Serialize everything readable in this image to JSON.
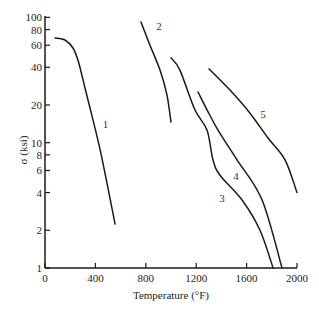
{
  "chart_data": {
    "type": "line",
    "title": "",
    "xlabel": "Temperature (°F)",
    "ylabel": "σ (ksi)",
    "xlim": [
      0,
      2000
    ],
    "ylim": [
      1,
      100
    ],
    "yscale": "log",
    "grid": false,
    "legend": "none (curves labeled inline 1–5)",
    "x_ticks": [
      0,
      400,
      800,
      1200,
      1600,
      2000
    ],
    "x_tick_labels": [
      "0",
      "400",
      "800",
      "1200",
      "1600",
      "2000"
    ],
    "y_ticks": [
      1,
      2,
      4,
      6,
      8,
      10,
      20,
      40,
      60,
      80,
      100
    ],
    "y_tick_labels": [
      "1",
      "2",
      "4",
      "6",
      "8",
      "10",
      "20",
      "40",
      "60",
      "80",
      "100"
    ],
    "series": [
      {
        "name": "1",
        "label_pos": [
          480,
          14
        ],
        "points": [
          [
            79,
            68.5
          ],
          [
            159,
            66
          ],
          [
            222,
            57
          ],
          [
            262,
            45.5
          ],
          [
            302,
            31.6
          ],
          [
            341,
            21.9
          ],
          [
            437,
            8.8
          ],
          [
            556,
            2.24
          ]
        ]
      },
      {
        "name": "2",
        "label_pos": [
          905,
          85
        ],
        "points": [
          [
            762,
            92
          ],
          [
            833,
            60
          ],
          [
            913,
            38
          ],
          [
            968,
            24
          ],
          [
            1000,
            14.6
          ]
        ]
      },
      {
        "name": "3",
        "label_pos": [
          1405,
          3.6
        ],
        "points": [
          [
            1000,
            47.5
          ],
          [
            1071,
            38
          ],
          [
            1190,
            18.3
          ],
          [
            1286,
            12.6
          ],
          [
            1333,
            7.3
          ],
          [
            1389,
            5.5
          ],
          [
            1563,
            3.5
          ],
          [
            1706,
            2.0
          ],
          [
            1810,
            1.0
          ]
        ]
      },
      {
        "name": "4",
        "label_pos": [
          1515,
          5.4
        ],
        "points": [
          [
            1214,
            25.4
          ],
          [
            1286,
            18.3
          ],
          [
            1373,
            12.6
          ],
          [
            1524,
            7.3
          ],
          [
            1722,
            3.5
          ],
          [
            1881,
            1.0
          ]
        ]
      },
      {
        "name": "5",
        "label_pos": [
          1730,
          17
        ],
        "points": [
          [
            1302,
            38.8
          ],
          [
            1468,
            26.3
          ],
          [
            1627,
            17.2
          ],
          [
            1770,
            10.9
          ],
          [
            1905,
            7.3
          ],
          [
            2000,
            4.0
          ]
        ]
      }
    ]
  }
}
